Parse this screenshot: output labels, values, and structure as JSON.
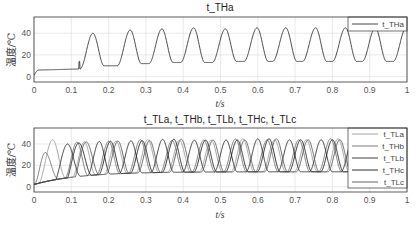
{
  "chart_data": [
    {
      "type": "line",
      "title": "t_THa",
      "xlabel": "t/s",
      "ylabel": "温度/℃",
      "xlim": [
        0,
        1
      ],
      "ylim": [
        -5,
        55
      ],
      "xticks": [
        "0",
        "0.1",
        "0.2",
        "0.3",
        "0.4",
        "0.5",
        "0.6",
        "0.7",
        "0.8",
        "0.9",
        "1"
      ],
      "yticks": [
        "0",
        "20",
        "40"
      ],
      "grid": true,
      "legend": {
        "position": "top-right",
        "entries": [
          "t_THa"
        ]
      },
      "series": [
        {
          "name": "t_THa",
          "color": "#333333",
          "initial": {
            "t": [
              0,
              0.005,
              0.01,
              0.12
            ],
            "v": [
              1,
              4,
              6,
              7
            ]
          },
          "peaks": [
            {
              "t": 0.158,
              "v": 40,
              "base_after": 10
            },
            {
              "t": 0.258,
              "v": 43,
              "base_after": 12
            },
            {
              "t": 0.343,
              "v": 44,
              "base_after": 13
            },
            {
              "t": 0.428,
              "v": 45,
              "base_after": 13
            },
            {
              "t": 0.513,
              "v": 44,
              "base_after": 14
            },
            {
              "t": 0.598,
              "v": 45,
              "base_after": 14
            },
            {
              "t": 0.675,
              "v": 45,
              "base_after": 14
            },
            {
              "t": 0.755,
              "v": 45,
              "base_after": 14
            },
            {
              "t": 0.835,
              "v": 45,
              "base_after": 14
            },
            {
              "t": 0.915,
              "v": 45,
              "base_after": 14
            },
            {
              "t": 0.998,
              "v": 45,
              "base_after": 14
            }
          ]
        }
      ]
    },
    {
      "type": "line",
      "title": "t_TLa, t_THb, t_TLb, t_THc, t_TLc",
      "xlabel": "t/s",
      "ylabel": "温度/℃",
      "xlim": [
        0,
        1
      ],
      "ylim": [
        -5,
        55
      ],
      "xticks": [
        "0",
        "0.1",
        "0.2",
        "0.3",
        "0.4",
        "0.5",
        "0.6",
        "0.7",
        "0.8",
        "0.9",
        "1"
      ],
      "yticks": [
        "0",
        "20",
        "40"
      ],
      "grid": true,
      "legend": {
        "position": "top-right",
        "entries": [
          "t_TLa",
          "t_THb",
          "t_TLb",
          "t_THc",
          "t_TLc"
        ]
      },
      "data_end_t": 0.85,
      "series": [
        {
          "name": "t_TLa",
          "color": "#9a9a9a",
          "phase": 0.0,
          "first_peak": 0.05,
          "first_peak_v": 44
        },
        {
          "name": "t_THb",
          "color": "#6e6e6e",
          "phase": 0.017,
          "first_peak": 0.03,
          "first_peak_v": 32
        },
        {
          "name": "t_TLb",
          "color": "#2a2a2a",
          "phase": 0.034,
          "first_peak": 0.09,
          "first_peak_v": 40
        },
        {
          "name": "t_THc",
          "color": "#1a1a1a",
          "phase": 0.051,
          "first_peak": 0.12,
          "first_peak_v": 41
        },
        {
          "name": "t_TLc",
          "color": "#555555",
          "phase": 0.068,
          "first_peak": 0.14,
          "first_peak_v": 42
        }
      ],
      "cycle_period": 0.085,
      "steady_peak_v": 44,
      "steady_base_v": 14
    }
  ],
  "labels": {
    "top_title": "t_THa",
    "bottom_title": "t_TLa, t_THb, t_TLb, t_THc, t_TLc",
    "xlabel": "t/s",
    "ylabel": "温度/℃"
  }
}
